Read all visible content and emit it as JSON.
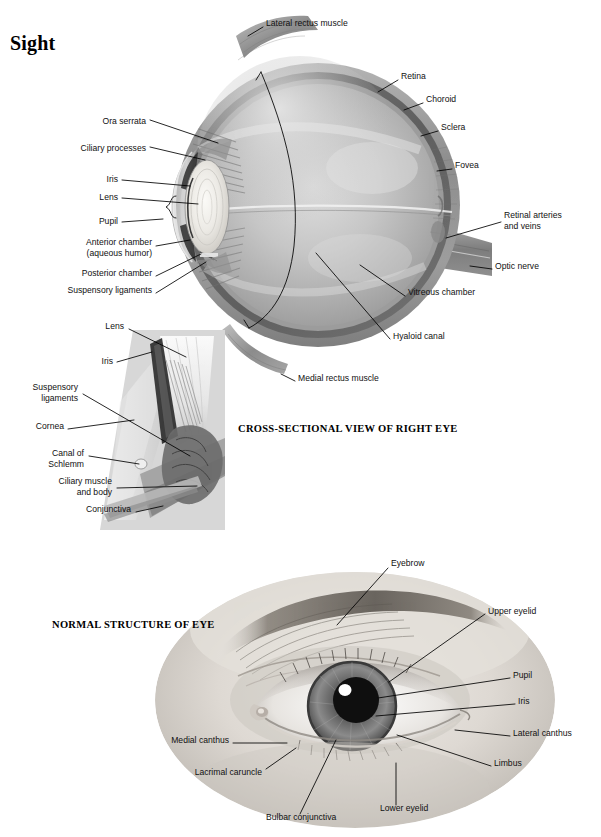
{
  "page": {
    "title": "Sight",
    "background": "#ffffff"
  },
  "figures": [
    {
      "id": "cross-section",
      "caption": "CROSS-SECTIONAL VIEW OF RIGHT EYE",
      "labels": [
        {
          "name": "lateral-rectus-muscle",
          "text": "Lateral rectus muscle",
          "align": "left",
          "x": 266,
          "y": 23
        },
        {
          "name": "retina",
          "text": "Retina",
          "align": "left",
          "x": 401,
          "y": 76
        },
        {
          "name": "choroid",
          "text": "Choroid",
          "align": "left",
          "x": 426,
          "y": 99
        },
        {
          "name": "sclera",
          "text": "Sclera",
          "align": "left",
          "x": 441,
          "y": 127
        },
        {
          "name": "fovea",
          "text": "Fovea",
          "align": "left",
          "x": 455,
          "y": 165
        },
        {
          "name": "retinal-arteries-and-veins",
          "text": "Retinal arteries\nand veins",
          "align": "left",
          "x": 504,
          "y": 216
        },
        {
          "name": "optic-nerve",
          "text": "Optic nerve",
          "align": "left",
          "x": 495,
          "y": 266
        },
        {
          "name": "vitreous-chamber",
          "text": "Vitreous chamber",
          "align": "left",
          "x": 408,
          "y": 292
        },
        {
          "name": "hyaloid-canal",
          "text": "Hyaloid canal",
          "align": "left",
          "x": 393,
          "y": 336
        },
        {
          "name": "medial-rectus-muscle",
          "text": "Medial rectus muscle",
          "align": "left",
          "x": 298,
          "y": 378
        },
        {
          "name": "ora-serrata",
          "text": "Ora serrata",
          "align": "right",
          "x": 146,
          "y": 122
        },
        {
          "name": "ciliary-processes",
          "text": "Ciliary processes",
          "align": "right",
          "x": 146,
          "y": 149
        },
        {
          "name": "iris",
          "text": "Iris",
          "align": "right",
          "x": 118,
          "y": 180
        },
        {
          "name": "lens",
          "text": "Lens",
          "align": "right",
          "x": 118,
          "y": 198
        },
        {
          "name": "pupil",
          "text": "Pupil",
          "align": "right",
          "x": 118,
          "y": 222
        },
        {
          "name": "anterior-chamber",
          "text": "Anterior chamber\n(aqueous humor)",
          "align": "right",
          "x": 152,
          "y": 243
        },
        {
          "name": "posterior-chamber",
          "text": "Posterior chamber",
          "align": "right",
          "x": 152,
          "y": 273
        },
        {
          "name": "suspensory-ligaments",
          "text": "Suspensory ligaments",
          "align": "right",
          "x": 152,
          "y": 290
        }
      ]
    },
    {
      "id": "anterior-detail-inset",
      "labels": [
        {
          "name": "lens",
          "text": "Lens",
          "align": "right",
          "x": 124,
          "y": 326
        },
        {
          "name": "iris",
          "text": "Iris",
          "align": "right",
          "x": 113,
          "y": 361
        },
        {
          "name": "suspensory-ligaments",
          "text": "Suspensory\nligaments",
          "align": "right",
          "x": 78,
          "y": 388
        },
        {
          "name": "cornea",
          "text": "Cornea",
          "align": "right",
          "x": 64,
          "y": 426
        },
        {
          "name": "canal-of-schlemm",
          "text": "Canal of\nSchlemm",
          "align": "right",
          "x": 84,
          "y": 454
        },
        {
          "name": "ciliary-muscle-and-body",
          "text": "Ciliary muscle\nand body",
          "align": "right",
          "x": 112,
          "y": 482
        },
        {
          "name": "conjunctiva",
          "text": "Conjunctiva",
          "align": "right",
          "x": 131,
          "y": 509
        }
      ]
    },
    {
      "id": "external-eye-photo",
      "caption": "NORMAL STRUCTURE OF EYE",
      "labels": [
        {
          "name": "eyebrow",
          "text": "Eyebrow",
          "align": "left",
          "x": 391,
          "y": 563
        },
        {
          "name": "upper-eyelid",
          "text": "Upper eyelid",
          "align": "left",
          "x": 488,
          "y": 611
        },
        {
          "name": "pupil",
          "text": "Pupil",
          "align": "left",
          "x": 513,
          "y": 675
        },
        {
          "name": "iris",
          "text": "Iris",
          "align": "left",
          "x": 518,
          "y": 701
        },
        {
          "name": "lateral-canthus",
          "text": "Lateral canthus",
          "align": "left",
          "x": 513,
          "y": 733
        },
        {
          "name": "limbus",
          "text": "Limbus",
          "align": "left",
          "x": 494,
          "y": 763
        },
        {
          "name": "medial-canthus",
          "text": "Medial canthus",
          "align": "right",
          "x": 229,
          "y": 740
        },
        {
          "name": "lacrimal-caruncle",
          "text": "Lacrimal caruncle",
          "align": "right",
          "x": 262,
          "y": 772
        },
        {
          "name": "bulbar-conjunctiva",
          "text": "Bulbar conjunctiva",
          "align": "left",
          "x": 266,
          "y": 817
        },
        {
          "name": "lower-eyelid",
          "text": "Lower eyelid",
          "align": "left",
          "x": 380,
          "y": 808
        }
      ]
    }
  ],
  "captions": [
    {
      "name": "caption-cross-section",
      "text": "CROSS-SECTIONAL VIEW OF RIGHT EYE",
      "x": 238,
      "y": 429
    },
    {
      "name": "caption-normal-structure",
      "text": "NORMAL STRUCTURE OF EYE",
      "x": 52,
      "y": 625
    }
  ],
  "palette": {
    "sclera_outer": "#8e8e8e",
    "sclera_mid": "#a8a8a8",
    "choroid": "#6f6f6f",
    "vitreous_light": "#d8d8d8",
    "vitreous_mid": "#b4b4b4",
    "lens_light": "#f0efec",
    "muscle": "#9a9a9a",
    "skin_light": "#e9e6e2",
    "skin_mid": "#c4bfb9",
    "brow_dark": "#6b6660",
    "iris_gray": "#7c7c7c",
    "pupil_dark": "#141414",
    "highlight": "#ffffff",
    "leader": "#000000"
  }
}
